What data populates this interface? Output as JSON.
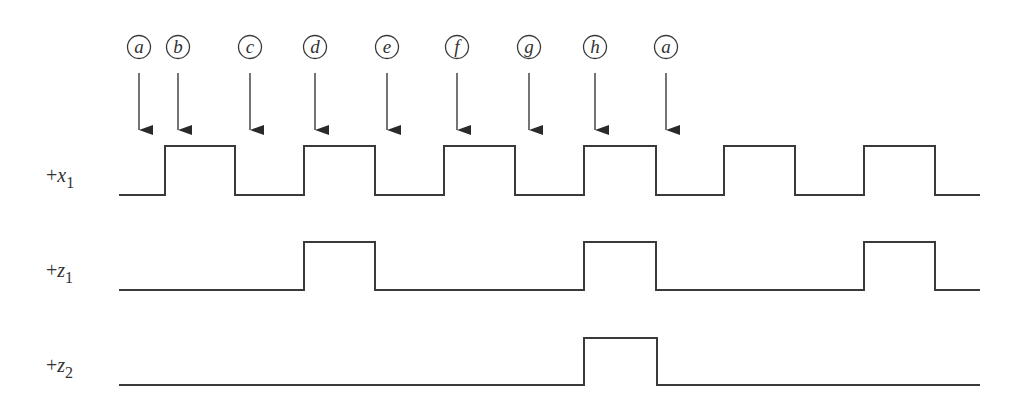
{
  "diagram": {
    "type": "timing-diagram",
    "clock_markers": [
      {
        "label": "a",
        "x": 139
      },
      {
        "label": "b",
        "x": 178
      },
      {
        "label": "c",
        "x": 250
      },
      {
        "label": "d",
        "x": 315
      },
      {
        "label": "e",
        "x": 387
      },
      {
        "label": "f",
        "x": 457
      },
      {
        "label": "g",
        "x": 529
      },
      {
        "label": "h",
        "x": 595
      },
      {
        "label": "a",
        "x": 666
      }
    ],
    "signals": [
      {
        "name": "+x1",
        "prefix": "+",
        "var": "x",
        "sub": "1",
        "low_y": 195,
        "high_y": 146,
        "label_y": 182,
        "x_start": 119,
        "x_end": 980,
        "high_intervals": [
          [
            165,
            235
          ],
          [
            304,
            375
          ],
          [
            444,
            515
          ],
          [
            584,
            656
          ],
          [
            724,
            795
          ],
          [
            864,
            935
          ]
        ]
      },
      {
        "name": "+z1",
        "prefix": "+",
        "var": "z",
        "sub": "1",
        "low_y": 290,
        "high_y": 242,
        "label_y": 277,
        "x_start": 119,
        "x_end": 980,
        "high_intervals": [
          [
            304,
            375
          ],
          [
            584,
            656
          ],
          [
            864,
            935
          ]
        ]
      },
      {
        "name": "+z2",
        "prefix": "+",
        "var": "z",
        "sub": "2",
        "low_y": 385,
        "high_y": 338,
        "label_y": 372,
        "x_start": 119,
        "x_end": 980,
        "high_intervals": [
          [
            584,
            657
          ]
        ]
      }
    ],
    "colors": {
      "line": "#3a3a3a",
      "text": "#333333"
    }
  }
}
